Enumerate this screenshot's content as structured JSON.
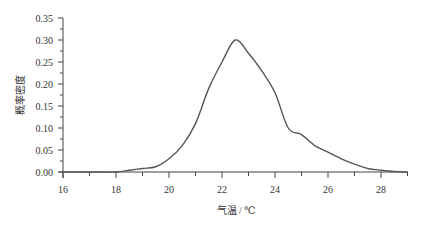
{
  "chart_data": {
    "type": "line",
    "title": "",
    "xlabel": "气温 / ℃",
    "ylabel": "概率密度",
    "xlim": [
      16,
      29
    ],
    "ylim": [
      0,
      0.35
    ],
    "grid": false,
    "legend": null,
    "x_ticks": [
      16,
      18,
      20,
      22,
      24,
      26,
      28
    ],
    "y_ticks": [
      "0.00",
      "0.05",
      "0.10",
      "0.15",
      "0.20",
      "0.25",
      "0.30",
      "0.35"
    ],
    "series": [
      {
        "name": "probability density",
        "x": [
          16.0,
          17.0,
          18.0,
          18.5,
          19.0,
          19.5,
          20.0,
          20.5,
          21.0,
          21.5,
          22.0,
          22.5,
          23.0,
          23.5,
          24.0,
          24.5,
          25.0,
          25.5,
          26.0,
          26.5,
          27.0,
          27.5,
          28.0,
          28.5,
          29.0
        ],
        "y": [
          0.0,
          0.0,
          0.0,
          0.004,
          0.008,
          0.012,
          0.03,
          0.06,
          0.11,
          0.19,
          0.25,
          0.3,
          0.27,
          0.23,
          0.18,
          0.1,
          0.085,
          0.06,
          0.045,
          0.03,
          0.018,
          0.008,
          0.004,
          0.001,
          0.0
        ]
      }
    ]
  }
}
